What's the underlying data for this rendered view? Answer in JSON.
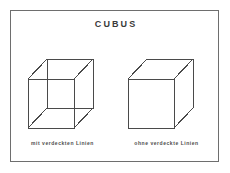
{
  "figure": {
    "title": "CUBUS",
    "frame_color": "#6e6e6e",
    "line_color": "#4a4a4a",
    "background": "#ffffff"
  },
  "panels": [
    {
      "id": "cube-with-hidden-lines",
      "caption": "mit verdeckten Linien",
      "edge_count": 12,
      "hidden_lines_shown": "true"
    },
    {
      "id": "cube-without-hidden-lines",
      "caption": "ohne verdeckte Linien",
      "edge_count": 9,
      "hidden_lines_shown": "false"
    }
  ]
}
